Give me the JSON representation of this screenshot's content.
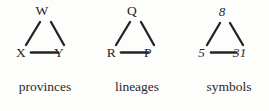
{
  "figure": {
    "background_color": "#fdfdfc",
    "ink_color": "#262626",
    "groups": [
      {
        "id": "provinces",
        "caption": "provinces",
        "node_style": "upright-roman-letters",
        "nodes": {
          "apex": "W",
          "left": "X",
          "right": "Y"
        },
        "edges": [
          {
            "from": "X",
            "to": "W"
          },
          {
            "from": "W",
            "to": "Y"
          },
          {
            "from": "X",
            "to": "Y"
          }
        ]
      },
      {
        "id": "lineages",
        "caption": "lineages",
        "node_style": "upright-roman-letters",
        "nodes": {
          "apex": "Q",
          "left": "R",
          "right": "P"
        },
        "edges": [
          {
            "from": "R",
            "to": "Q"
          },
          {
            "from": "Q",
            "to": "P"
          },
          {
            "from": "R",
            "to": "P"
          }
        ]
      },
      {
        "id": "symbols",
        "caption": "symbols",
        "node_style": "italic-numerals",
        "nodes": {
          "apex": "8",
          "left": "5",
          "right": "31"
        },
        "edges": [
          {
            "from": "5",
            "to": "8"
          },
          {
            "from": "8",
            "to": "31"
          },
          {
            "from": "5",
            "to": "31"
          }
        ]
      }
    ]
  }
}
